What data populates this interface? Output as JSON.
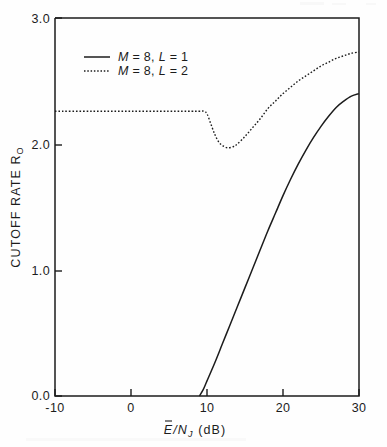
{
  "figure": {
    "background_color": "#fefefe",
    "ink_color": "#1c1c1c"
  },
  "axes": {
    "x": {
      "title_main": "E",
      "title_slash": "/N",
      "title_sub": "J",
      "title_units": "(dB)",
      "title_full": "E/N_J (dB)",
      "ticks": [
        "-10",
        "0",
        "10",
        "20",
        "30"
      ],
      "range": [
        -10,
        30
      ]
    },
    "y": {
      "title_main": "CUTOFF RATE R",
      "title_sub": "O",
      "title_full": "CUTOFF RATE R_O",
      "ticks": [
        "0.0",
        "1.0",
        "2.0",
        "3.0"
      ],
      "range": [
        0.0,
        3.0
      ]
    }
  },
  "legend": {
    "entries": [
      {
        "label": "M = 8, L = 1",
        "m": "M",
        "m_val": " = 8, ",
        "l": "L",
        "l_val": " = 1",
        "style": "solid"
      },
      {
        "label": "M = 8, L = 2",
        "m": "M",
        "m_val": " = 8, ",
        "l": "L",
        "l_val": " = 2",
        "style": "dotted"
      }
    ]
  },
  "chart_data": {
    "type": "line",
    "title": "",
    "xlabel": "E/N_J (dB)",
    "ylabel": "CUTOFF RATE R_O",
    "xlim": [
      -10,
      30
    ],
    "ylim": [
      0.0,
      3.0
    ],
    "xticks": [
      -10,
      0,
      10,
      20,
      30
    ],
    "yticks": [
      0.0,
      1.0,
      2.0,
      3.0
    ],
    "grid": false,
    "legend_position": "upper-left",
    "series": [
      {
        "name": "M = 8, L = 1",
        "style": "solid",
        "color": "#1c1c1c",
        "x": [
          9.0,
          9.5,
          10.0,
          11.0,
          12.0,
          13.0,
          14.0,
          15.0,
          16.0,
          17.0,
          18.0,
          19.0,
          20.0,
          21.0,
          22.0,
          23.0,
          24.0,
          25.0,
          26.0,
          27.0,
          28.0,
          29.0,
          30.0
        ],
        "y": [
          0.0,
          0.05,
          0.12,
          0.26,
          0.41,
          0.56,
          0.71,
          0.86,
          1.01,
          1.16,
          1.31,
          1.45,
          1.59,
          1.72,
          1.84,
          1.95,
          2.05,
          2.14,
          2.22,
          2.29,
          2.34,
          2.38,
          2.4
        ]
      },
      {
        "name": "M = 8, L = 2",
        "style": "dotted",
        "color": "#1c1c1c",
        "x": [
          -10.0,
          -5.0,
          0.0,
          5.0,
          8.0,
          9.0,
          9.6,
          10.0,
          10.5,
          11.0,
          11.5,
          12.0,
          12.7,
          13.5,
          14.0,
          15.0,
          16.0,
          17.0,
          18.0,
          19.0,
          20.0,
          21.0,
          22.0,
          23.0,
          24.0,
          25.0,
          26.0,
          27.0,
          28.0,
          29.0,
          30.0
        ],
        "y": [
          2.26,
          2.26,
          2.26,
          2.26,
          2.26,
          2.26,
          2.26,
          2.24,
          2.16,
          2.08,
          2.02,
          1.99,
          1.97,
          1.98,
          2.0,
          2.06,
          2.13,
          2.2,
          2.28,
          2.34,
          2.4,
          2.45,
          2.5,
          2.54,
          2.58,
          2.62,
          2.65,
          2.68,
          2.7,
          2.72,
          2.73
        ]
      }
    ]
  }
}
